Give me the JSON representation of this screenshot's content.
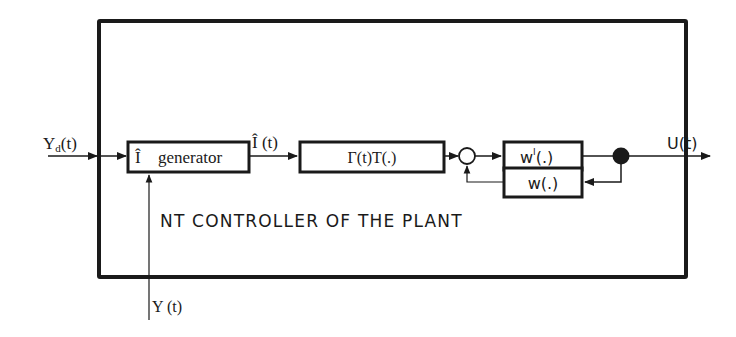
{
  "diagram": {
    "title": "NT CONTROLLER OF THE PLANT",
    "inputs": {
      "desired_output": {
        "label": "Y",
        "subscript": "d",
        "suffix": "(t)"
      },
      "measured_output": {
        "label": "Y (t)"
      }
    },
    "output": {
      "label": "U(t)"
    },
    "blocks": {
      "generator": {
        "symbol": "Î",
        "label": "generator"
      },
      "gamma_t": {
        "label": "Γ(t)T(.)"
      },
      "w_inverse": {
        "label": "w",
        "superscript": "I",
        "suffix": "(.)"
      },
      "w": {
        "label": "w(.)"
      }
    },
    "signals": {
      "i_hat": {
        "label": "Î (t)"
      }
    },
    "colors": {
      "line": "#1a1a1a",
      "background": "#ffffff"
    }
  }
}
